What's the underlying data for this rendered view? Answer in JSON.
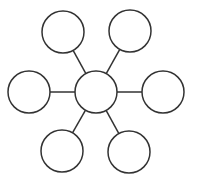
{
  "canvas": {
    "width": 197,
    "height": 182,
    "background": "#ffffff"
  },
  "style": {
    "stroke": "#333333",
    "fill": "#ffffff"
  },
  "diagram": {
    "type": "hub-and-spoke",
    "center": {
      "id": "center",
      "cx": 96,
      "cy": 92,
      "r": 21,
      "label": ""
    },
    "nodes": [
      {
        "id": "top-left",
        "cx": 63,
        "cy": 32,
        "r": 21,
        "label": ""
      },
      {
        "id": "top-right",
        "cx": 130,
        "cy": 31,
        "r": 21,
        "label": ""
      },
      {
        "id": "left",
        "cx": 29,
        "cy": 92,
        "r": 21,
        "label": ""
      },
      {
        "id": "right",
        "cx": 163,
        "cy": 92,
        "r": 21,
        "label": ""
      },
      {
        "id": "bottom-left",
        "cx": 62,
        "cy": 151,
        "r": 21,
        "label": ""
      },
      {
        "id": "bottom-right",
        "cx": 129,
        "cy": 152,
        "r": 21,
        "label": ""
      }
    ]
  }
}
